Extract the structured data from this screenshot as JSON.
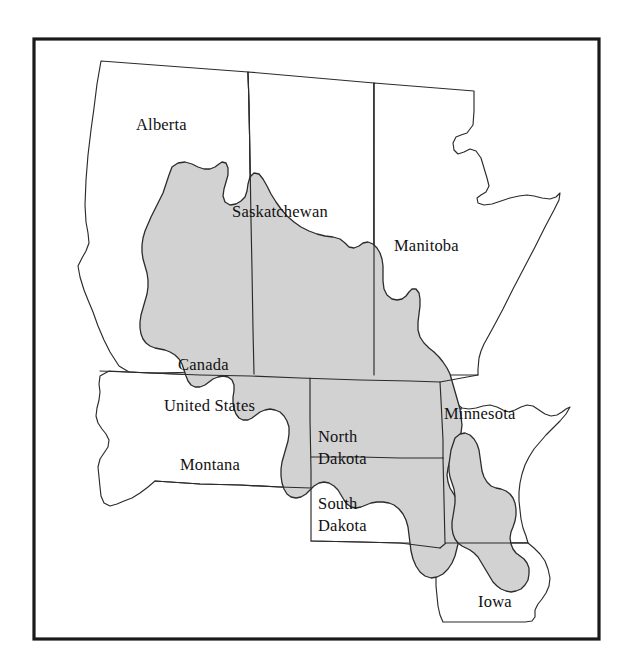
{
  "figure": {
    "frame": {
      "stroke_color": "#1a1a1a",
      "fill_color": "#ffffff"
    },
    "shaded_region": {
      "name": "shaded-study-area",
      "fill_color": "#d2d2d2",
      "stroke_color": "#2b2b2b"
    },
    "outline_color": "#2b2b2b"
  },
  "labels": {
    "alberta": "Alberta",
    "saskatchewan": "Saskatchewan",
    "manitoba": "Manitoba",
    "canada": "Canada",
    "united_states": "United States",
    "montana": "Montana",
    "north_dakota_line1": "North",
    "north_dakota_line2": "Dakota",
    "south_dakota_line1": "South",
    "south_dakota_line2": "Dakota",
    "minnesota": "Minnesota",
    "iowa": "Iowa"
  },
  "regions": [
    {
      "id": "alberta",
      "label": "Alberta",
      "country": "Canada",
      "shaded": "partial"
    },
    {
      "id": "saskatchewan",
      "label": "Saskatchewan",
      "country": "Canada",
      "shaded": "partial"
    },
    {
      "id": "manitoba",
      "label": "Manitoba",
      "country": "Canada",
      "shaded": "partial"
    },
    {
      "id": "montana",
      "label": "Montana",
      "country": "United States",
      "shaded": "none"
    },
    {
      "id": "north-dakota",
      "label": "North Dakota",
      "country": "United States",
      "shaded": "partial"
    },
    {
      "id": "south-dakota",
      "label": "South Dakota",
      "country": "United States",
      "shaded": "partial"
    },
    {
      "id": "minnesota",
      "label": "Minnesota",
      "country": "United States",
      "shaded": "partial"
    },
    {
      "id": "iowa",
      "label": "Iowa",
      "country": "United States",
      "shaded": "partial"
    }
  ],
  "countries": [
    {
      "id": "canada",
      "label": "Canada"
    },
    {
      "id": "united-states",
      "label": "United States"
    }
  ]
}
